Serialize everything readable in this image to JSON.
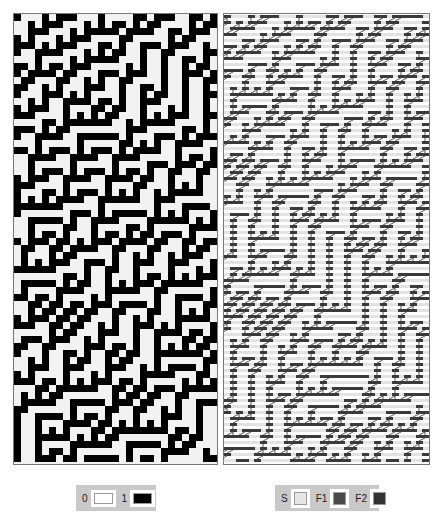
{
  "left_panel": {
    "title": "",
    "rule": 45,
    "cell_size": 7,
    "cols": 29,
    "rows": 64,
    "colors": {
      "0": "#f2f2f2",
      "1": "#000000"
    }
  },
  "right_panel": {
    "title": "",
    "rule": 45,
    "cell_size": 6,
    "cols": 34,
    "rows": 75,
    "colors": {
      "S": "#e3e3e3",
      "F1": "#555555",
      "F2": "#3a3a3a",
      "background": "#ffffff"
    }
  },
  "legend_left": {
    "items": [
      {
        "label": "0",
        "color": "#ffffff"
      },
      {
        "label": "1",
        "color": "#000000"
      }
    ]
  },
  "legend_right": {
    "items": [
      {
        "label": "S",
        "color": "#e6e6e6"
      },
      {
        "label": "F1",
        "color": "#4a4a4a"
      },
      {
        "label": "F2",
        "color": "#333333"
      }
    ]
  }
}
